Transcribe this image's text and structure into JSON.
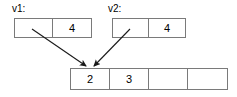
{
  "diagram": {
    "type": "array-pointer-diagram",
    "background_color": "#ffffff",
    "line_color": "#7a7a7a",
    "arrow_color": "#1a1a1a",
    "text_color": "#000000"
  },
  "vectors": [
    {
      "label": "v1:",
      "cells": [
        "",
        "4"
      ]
    },
    {
      "label": "v2:",
      "cells": [
        "",
        "4"
      ]
    }
  ],
  "result": {
    "cells": [
      "2",
      "3",
      "",
      ""
    ]
  },
  "arrows": [
    {
      "name": "v1-to-result",
      "from": "v1-cell-0",
      "to": "result-cell-0"
    },
    {
      "name": "v2-to-result",
      "from": "v2-cell-0",
      "to": "result-cell-0"
    }
  ]
}
